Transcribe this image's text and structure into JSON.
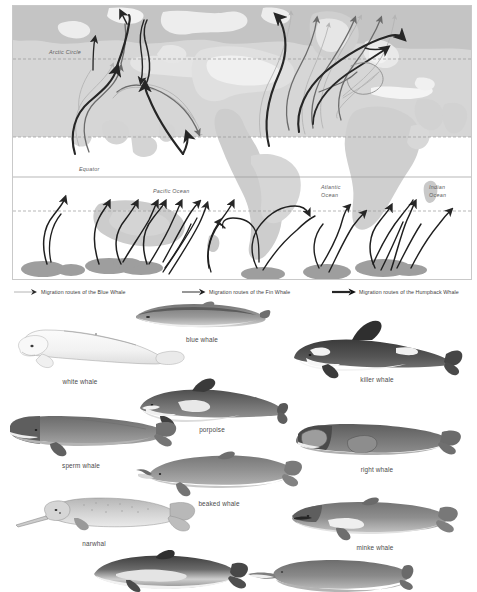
{
  "map": {
    "geo_labels": [
      {
        "name": "arctic-circle",
        "text": "Arctic Circle"
      },
      {
        "name": "equator",
        "text": "Equator"
      },
      {
        "name": "pacific-ocean",
        "text": "Pacific Ocean"
      },
      {
        "name": "atlantic-ocean",
        "text": "Atlantic\nOcean"
      },
      {
        "name": "indian-ocean",
        "text": "Indian\nOcean"
      }
    ],
    "colors": {
      "land": "#c9c9c9",
      "cold_band": "#d2d2d2",
      "feeding_ground": "#9a9a9a",
      "graticule": "#9d9d9d",
      "frame": "#c9c9c9",
      "blue_whale_route": "#b8b8b8",
      "fin_whale_route": "#6f6f6f",
      "humpback_whale_route": "#2a2a2a",
      "southern_route": "#1f1f1f"
    }
  },
  "legend": {
    "items": [
      {
        "label": "Migration routes of the Blue Whale",
        "color": "#b4b4b4",
        "weight": 0.9
      },
      {
        "label": "Migration routes of the Fin Whale",
        "color": "#6b6b6b",
        "weight": 1.4
      },
      {
        "label": "Migration routes of the Humpback Whale",
        "color": "#262626",
        "weight": 2.2
      }
    ]
  },
  "plates": {
    "items": [
      {
        "name": "blue-whale",
        "label": "blue whale"
      },
      {
        "name": "white-whale",
        "label": "white whale"
      },
      {
        "name": "killer-whale",
        "label": "killer whale"
      },
      {
        "name": "porpoise",
        "label": "porpoise"
      },
      {
        "name": "sperm-whale",
        "label": "sperm whale"
      },
      {
        "name": "right-whale",
        "label": "right whale"
      },
      {
        "name": "beaked-whale",
        "label": "beaked whale"
      },
      {
        "name": "narwhal",
        "label": "narwhal"
      },
      {
        "name": "minke-whale",
        "label": "minke whale"
      },
      {
        "name": "dolphin-lower-left",
        "label": ""
      },
      {
        "name": "river-dolphin-lower-right",
        "label": ""
      }
    ]
  }
}
